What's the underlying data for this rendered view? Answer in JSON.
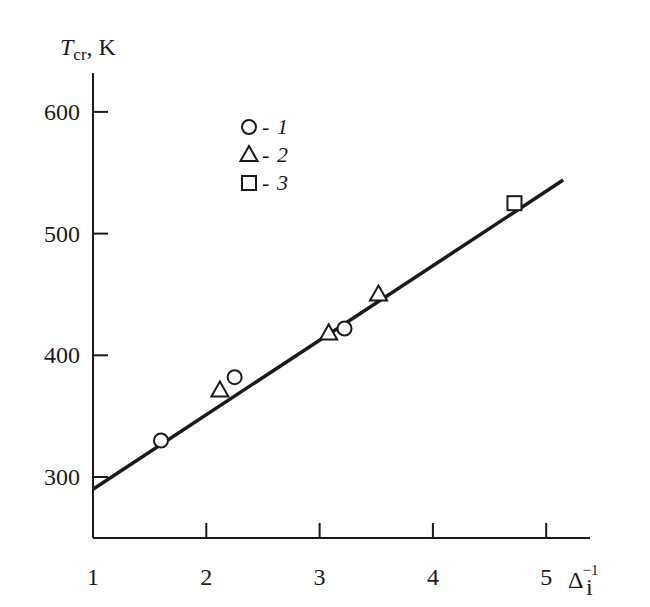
{
  "chart_data": {
    "type": "scatter",
    "title": "",
    "xlabel": "Δ_i^-1",
    "xlabel_main": "Δ",
    "xlabel_sub": "i",
    "xlabel_sup": "−1",
    "ylabel": "T_cr, K",
    "ylabel_main": "T",
    "ylabel_sub": "cr",
    "ylabel_unit": ", K",
    "xlim": [
      1,
      5.4
    ],
    "ylim": [
      270,
      630
    ],
    "x_ticks": [
      1,
      2,
      3,
      4,
      5
    ],
    "x_tick_labels": [
      "1",
      "2",
      "3",
      "4",
      "5"
    ],
    "y_ticks": [
      300,
      400,
      500,
      600
    ],
    "y_tick_labels": [
      "300",
      "400",
      "500",
      "600"
    ],
    "grid": false,
    "legend_position": "upper-left-inside",
    "series": [
      {
        "name": "1",
        "marker": "circle",
        "points": [
          [
            1.6,
            330
          ],
          [
            2.25,
            382
          ],
          [
            3.22,
            422
          ]
        ]
      },
      {
        "name": "2",
        "marker": "triangle",
        "points": [
          [
            2.12,
            371
          ],
          [
            3.08,
            418
          ],
          [
            3.52,
            450
          ]
        ]
      },
      {
        "name": "3",
        "marker": "square",
        "points": [
          [
            4.72,
            525
          ]
        ]
      }
    ],
    "fit_line": {
      "name": "linear fit",
      "x": [
        1.0,
        5.15
      ],
      "y": [
        290,
        544
      ]
    },
    "legend": [
      {
        "marker": "circle",
        "dash": "-",
        "label": "1"
      },
      {
        "marker": "triangle",
        "dash": "-",
        "label": "2"
      },
      {
        "marker": "square",
        "dash": "-",
        "label": "3"
      }
    ]
  }
}
